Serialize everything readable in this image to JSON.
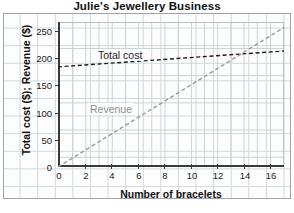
{
  "chart_data": {
    "type": "line",
    "title": "Julie's Jewellery Business",
    "xlabel": "Number of bracelets",
    "ylabel": "Total cost ($); Revenue ($)",
    "xlim": [
      0,
      17
    ],
    "ylim": [
      0,
      265
    ],
    "xticks": [
      "0",
      "2",
      "4",
      "6",
      "8",
      "10",
      "12",
      "14",
      "16"
    ],
    "yticks": [
      "0",
      "50",
      "100",
      "150",
      "200",
      "250"
    ],
    "grid": true,
    "legend_position": "inline-annotations",
    "series": [
      {
        "name": "Total cost",
        "style": "dashed",
        "color": "#1f1f1f",
        "x": [
          0,
          17
        ],
        "values": [
          183,
          212
        ],
        "annotation": "Total cost"
      },
      {
        "name": "Revenue",
        "style": "dashed",
        "color": "#9a9a9a",
        "x": [
          0,
          17
        ],
        "values": [
          0,
          255
        ],
        "annotation": "Revenue"
      }
    ],
    "intersection": {
      "x": 12,
      "y": 200
    }
  },
  "annotations": {
    "total_cost": "Total cost",
    "revenue": "Revenue"
  }
}
